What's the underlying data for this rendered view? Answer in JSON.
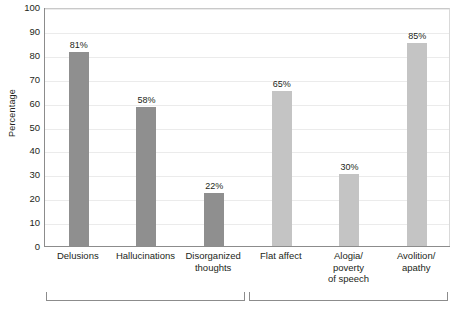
{
  "chart_data": {
    "type": "bar",
    "title": "",
    "xlabel": "",
    "ylabel": "Percentage",
    "ylim": [
      0,
      100
    ],
    "ytick_step": 10,
    "yticks": [
      100,
      90,
      80,
      70,
      60,
      50,
      40,
      30,
      20,
      10,
      0
    ],
    "grid": true,
    "legend": "none",
    "categories": [
      "Delusions",
      "Hallucinations",
      "Disorganized thoughts",
      "Flat affect",
      "Alogia/ poverty of speech",
      "Avolition/ apathy"
    ],
    "category_lines": [
      [
        "Delusions"
      ],
      [
        "Hallucinations"
      ],
      [
        "Disorganized",
        "thoughts"
      ],
      [
        "Flat affect"
      ],
      [
        "Alogia/",
        "poverty",
        "of speech"
      ],
      [
        "Avolition/",
        "apathy"
      ]
    ],
    "values": [
      81,
      58,
      22,
      65,
      30,
      85
    ],
    "value_labels": [
      "81%",
      "58%",
      "22%",
      "65%",
      "30%",
      "85%"
    ],
    "bar_colors": [
      "#8f8f8f",
      "#8f8f8f",
      "#8f8f8f",
      "#c4c4c4",
      "#c4c4c4",
      "#c4c4c4"
    ],
    "groups": [
      {
        "label": "",
        "from": 0,
        "to": 2
      },
      {
        "label": "",
        "from": 3,
        "to": 5
      }
    ]
  },
  "colors": {
    "bar_dark": "#8f8f8f",
    "bar_light": "#c4c4c4",
    "gridline": "#ebebeb",
    "axis": "#8c8c8c",
    "text": "#231f20",
    "background": "#ffffff"
  }
}
